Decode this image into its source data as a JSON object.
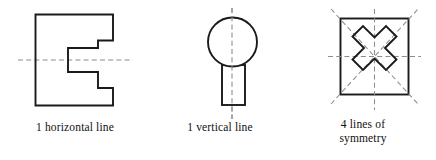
{
  "page": {
    "width": 436,
    "height": 160,
    "background_color": "#ffffff",
    "stroke_color": "#1a1a1a",
    "dash_color": "#8d8d8d"
  },
  "figures": [
    {
      "id": "e-shape",
      "name": "block-e-shape",
      "shape_description": "backwards-E block polygon with two right-side notches",
      "symmetry_lines": [
        {
          "type": "horizontal",
          "x1": 18,
          "y1": 60,
          "x2": 133,
          "y2": 60
        }
      ],
      "caption": {
        "lines": [
          "1 horizontal line"
        ],
        "full_text": "1 horizontal line"
      }
    },
    {
      "id": "balloon-shape",
      "name": "circle-with-rectangle-shape",
      "shape_description": "circle above a vertical rectangle, like a balloon or lollipop",
      "symmetry_lines": [
        {
          "type": "vertical",
          "x1": 82,
          "y1": 8,
          "x2": 82,
          "y2": 119
        }
      ],
      "caption": {
        "lines": [
          "1 vertical line"
        ],
        "full_text": "1 vertical line"
      }
    },
    {
      "id": "square-with-x",
      "name": "square-with-diagonal-cross-shape",
      "shape_description": "square outline containing a thick diagonal X cross",
      "symmetry_lines": [
        {
          "type": "vertical",
          "x1": 84,
          "y1": 12,
          "x2": 84,
          "y2": 116
        },
        {
          "type": "horizontal",
          "x1": 28,
          "y1": 64,
          "x2": 140,
          "y2": 64
        },
        {
          "type": "diagonal-down",
          "x1": 34,
          "y1": 14,
          "x2": 133,
          "y2": 113
        },
        {
          "type": "diagonal-up",
          "x1": 34,
          "y1": 113,
          "x2": 133,
          "y2": 14
        }
      ],
      "caption": {
        "lines": [
          "4 lines of",
          "symmetry"
        ],
        "full_text": "4 lines of symmetry"
      }
    }
  ]
}
